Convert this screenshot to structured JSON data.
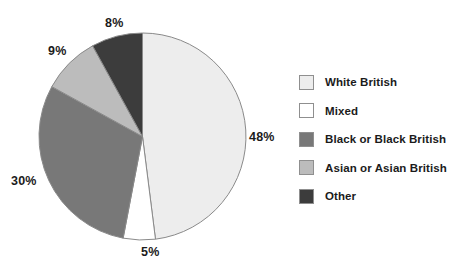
{
  "chart_data": {
    "type": "pie",
    "title": "",
    "categories": [
      "White British",
      "Mixed",
      "Black or Black British",
      "Asian or Asian British",
      "Other"
    ],
    "values": [
      48,
      5,
      30,
      9,
      8
    ],
    "value_labels": [
      "48%",
      "5%",
      "30%",
      "9%",
      "8%"
    ],
    "unit": "%",
    "start_angle_deg": 0,
    "direction": "clockwise",
    "legend_position": "right",
    "grid": false,
    "colors": [
      "#ededed",
      "#ffffff",
      "#787878",
      "#bcbcbc",
      "#3c3c3c"
    ],
    "slice_border_color": "#8a8a8a",
    "label_color": "#1b1b1b",
    "background": "#ffffff"
  },
  "legend": {
    "items": [
      {
        "label": "White British",
        "color": "#ededed"
      },
      {
        "label": "Mixed",
        "color": "#ffffff"
      },
      {
        "label": "Black or Black British",
        "color": "#787878"
      },
      {
        "label": "Asian or Asian British",
        "color": "#bcbcbc"
      },
      {
        "label": "Other",
        "color": "#3c3c3c"
      }
    ]
  },
  "labels": {
    "white_british": "48%",
    "mixed": "5%",
    "black_british": "30%",
    "asian_british": "9%",
    "other": "8%"
  }
}
